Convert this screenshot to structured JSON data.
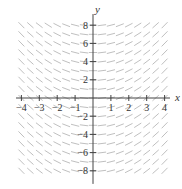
{
  "chart_data": {
    "type": "slope_field",
    "title": "",
    "equation": "dy/dx = x/2",
    "xlabel": "x",
    "ylabel": "y",
    "xlim": [
      -4.3,
      4.3
    ],
    "ylim": [
      -9,
      9
    ],
    "x_ticks": [
      -4,
      -3,
      -2,
      -1,
      1,
      2,
      3,
      4
    ],
    "y_ticks": [
      -8,
      -6,
      -4,
      -2,
      2,
      4,
      6,
      8
    ],
    "x_tick_labels": [
      "-4",
      "-3",
      "-2",
      "-1",
      "1",
      "2",
      "3",
      "4"
    ],
    "y_tick_labels": [
      "-8",
      "-6",
      "-4",
      "-2",
      "2",
      "4",
      "6",
      "8"
    ],
    "grid": false,
    "field_sampling": {
      "x_step": 0.5,
      "y_step": 1,
      "x_range": [
        -4,
        4
      ],
      "y_range": [
        -8,
        8
      ]
    },
    "colors": {
      "segments": "#b8b8b8",
      "axes": "#444444",
      "text": "#333333"
    }
  },
  "layout": {
    "origin_px": [
      93,
      98
    ],
    "px_per_x_unit": 17.9,
    "px_per_y_unit": 9.1,
    "segment_half_len_px": 4.2
  }
}
